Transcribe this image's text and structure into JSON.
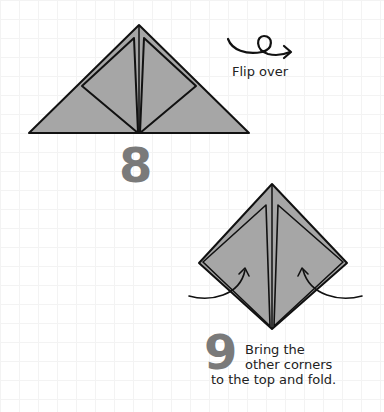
{
  "steps": [
    {
      "number": "8",
      "instruction": "Flip over",
      "icon": "flip-over-arrow-icon"
    },
    {
      "number": "9",
      "instruction_lines": [
        "Bring the",
        "other corners",
        "to the top and fold."
      ],
      "icon": "fold-arrow-icon"
    }
  ],
  "colors": {
    "paper": "#a6a6a6",
    "outline": "#111111",
    "number": "#7a7a7a",
    "text": "#222222",
    "grid": "#f3f3f3"
  }
}
